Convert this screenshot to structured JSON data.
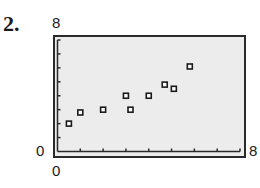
{
  "problem": {
    "number": "2."
  },
  "axes": {
    "y_max_label": "8",
    "y_min_label": "0",
    "x_min_label": "0",
    "x_max_label": "8"
  },
  "chart_data": {
    "type": "scatter",
    "title": "",
    "xlabel": "",
    "ylabel": "",
    "xlim": [
      0,
      8
    ],
    "ylim": [
      0,
      8
    ],
    "x_ticks": [
      0,
      1,
      2,
      3,
      4,
      5,
      6,
      7,
      8
    ],
    "y_ticks": [
      0,
      1,
      2,
      3,
      4,
      5,
      6,
      7,
      8
    ],
    "tick_labels_shown": {
      "x": [
        "0",
        "8"
      ],
      "y": [
        "0",
        "8"
      ]
    },
    "grid": false,
    "legend": null,
    "marker": "hollow-square",
    "series": [
      {
        "name": "data",
        "points": [
          {
            "x": 0.5,
            "y": 2.0
          },
          {
            "x": 1.0,
            "y": 2.8
          },
          {
            "x": 2.0,
            "y": 3.0
          },
          {
            "x": 3.0,
            "y": 4.0
          },
          {
            "x": 3.2,
            "y": 3.0
          },
          {
            "x": 4.0,
            "y": 4.0
          },
          {
            "x": 4.7,
            "y": 4.8
          },
          {
            "x": 5.1,
            "y": 4.5
          },
          {
            "x": 5.8,
            "y": 6.1
          }
        ]
      }
    ]
  },
  "colors": {
    "frame": "#2a2a2a",
    "plot_background": "#ececec",
    "marker": "#1a1a1a"
  }
}
